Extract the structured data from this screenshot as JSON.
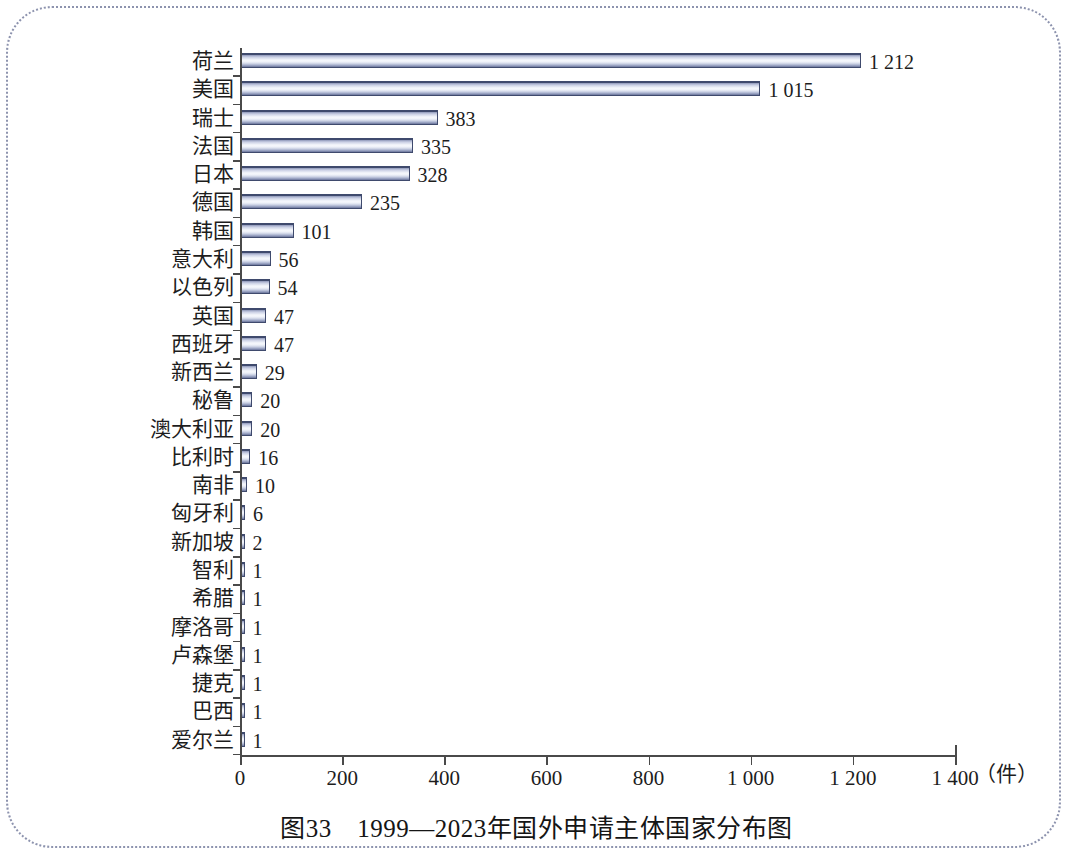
{
  "figure": {
    "caption": "图33　1999—2023年国外申请主体国家分布图",
    "unit_label": "（件）"
  },
  "chart_data": {
    "type": "bar",
    "orientation": "horizontal",
    "title": "图33　1999—2023年国外申请主体国家分布图",
    "xlabel": "（件）",
    "ylabel": "",
    "xlim": [
      0,
      1400
    ],
    "grid": false,
    "legend": null,
    "x_ticks": [
      0,
      200,
      400,
      600,
      800,
      1000,
      1200,
      1400
    ],
    "x_tick_labels": [
      "0",
      "200",
      "400",
      "600",
      "800",
      "1 000",
      "1 200",
      "1 400"
    ],
    "categories": [
      "荷兰",
      "美国",
      "瑞士",
      "法国",
      "日本",
      "德国",
      "韩国",
      "意大利",
      "以色列",
      "英国",
      "西班牙",
      "新西兰",
      "秘鲁",
      "澳大利亚",
      "比利时",
      "南非",
      "匈牙利",
      "新加坡",
      "智利",
      "希腊",
      "摩洛哥",
      "卢森堡",
      "捷克",
      "巴西",
      "爱尔兰"
    ],
    "values": [
      1212,
      1015,
      383,
      335,
      328,
      235,
      101,
      56,
      54,
      47,
      47,
      29,
      20,
      20,
      16,
      10,
      6,
      2,
      1,
      1,
      1,
      1,
      1,
      1,
      1
    ],
    "value_labels": [
      "1 212",
      "1 015",
      "383",
      "335",
      "328",
      "235",
      "101",
      "56",
      "54",
      "47",
      "47",
      "29",
      "20",
      "20",
      "16",
      "10",
      "6",
      "2",
      "1",
      "1",
      "1",
      "1",
      "1",
      "1",
      "1"
    ],
    "bar_color": "#8d96b8",
    "bar_edge_color": "#3f4a6d"
  }
}
